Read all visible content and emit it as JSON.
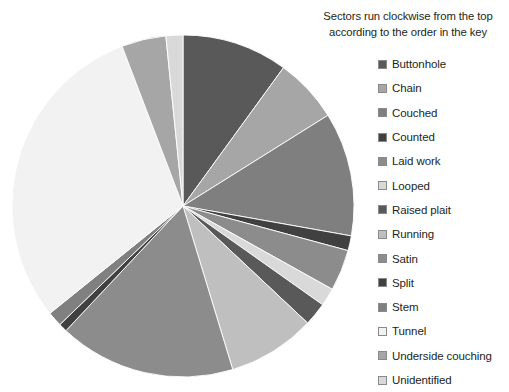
{
  "legend": {
    "title_line1": "Sectors run clockwise from the top",
    "title_line2": "according to the order in the key"
  },
  "chart_data": {
    "type": "pie",
    "title": "Sectors run clockwise from the top according to the order in the key",
    "subtitle": "",
    "xlabel": "",
    "ylabel": "",
    "grid": false,
    "legend_position": "right",
    "start_angle_deg_from_top": 0,
    "direction": "clockwise",
    "labels": [
      "Buttonhole",
      "Chain",
      "Couched",
      "Counted",
      "Laid work",
      "Looped",
      "Raised plait",
      "Running",
      "Satin",
      "Split",
      "Stem",
      "Tunnel",
      "Underside couching",
      "Unidentified"
    ],
    "values": [
      10.0,
      6.1,
      11.7,
      1.4,
      3.9,
      1.7,
      2.2,
      8.3,
      16.7,
      0.8,
      1.4,
      30.0,
      4.2,
      1.6
    ],
    "units": "percent",
    "colors": [
      "#595959",
      "#a6a6a6",
      "#7f7f7f",
      "#404040",
      "#8c8c8c",
      "#d9d9d9",
      "#595959",
      "#bfbfbf",
      "#8c8c8c",
      "#404040",
      "#808080",
      "#f2f2f2",
      "#a6a6a6",
      "#d9d9d9"
    ],
    "sector_boundaries_deg_clockwise_from_top": [
      0,
      36,
      58,
      100,
      105,
      119,
      125,
      133,
      163,
      223,
      226,
      231,
      339,
      354,
      360
    ],
    "geometry": {
      "center_x": 183,
      "center_y": 206,
      "radius": 171
    }
  }
}
